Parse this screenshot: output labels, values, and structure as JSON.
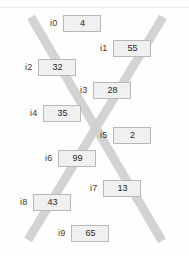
{
  "panel": {
    "background_color": "#fefefe",
    "rule_color": "#ededed"
  },
  "overlay": {
    "name": "x-cross-overlay",
    "color": "#cfcfcf",
    "stroke_width": 9,
    "strokes": [
      {
        "name": "stroke-top-left-to-bottom-right",
        "x1": 31,
        "y1": 17,
        "x2": 162,
        "y2": 241
      },
      {
        "name": "stroke-top-right-to-bottom-left",
        "x1": 163,
        "y1": 17,
        "x2": 28,
        "y2": 240
      }
    ]
  },
  "items": [
    {
      "label": "i0",
      "value": "4",
      "left": 50,
      "top": 15
    },
    {
      "label": "i1",
      "value": "55",
      "left": 100,
      "top": 40
    },
    {
      "label": "i2",
      "value": "32",
      "left": 25,
      "top": 59
    },
    {
      "label": "i3",
      "value": "28",
      "left": 80,
      "top": 82
    },
    {
      "label": "i4",
      "value": "35",
      "left": 30,
      "top": 105
    },
    {
      "label": "i5",
      "value": "2",
      "left": 100,
      "top": 127
    },
    {
      "label": "i6",
      "value": "99",
      "left": 45,
      "top": 150
    },
    {
      "label": "i7",
      "value": "13",
      "left": 90,
      "top": 180
    },
    {
      "label": "i8",
      "value": "43",
      "left": 20,
      "top": 194
    },
    {
      "label": "i9",
      "value": "65",
      "left": 58,
      "top": 225
    }
  ]
}
